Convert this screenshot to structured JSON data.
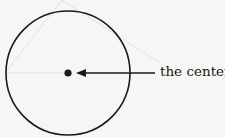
{
  "diagram": {
    "label": "the center",
    "circle": {
      "cx": 68,
      "cy": 73,
      "r": 63
    },
    "center_point": {
      "x": 68,
      "y": 73
    },
    "colors": {
      "ink": "#1a1a1a",
      "background": "#f6f6f4",
      "faint_lines": "#d8d8d4"
    }
  }
}
